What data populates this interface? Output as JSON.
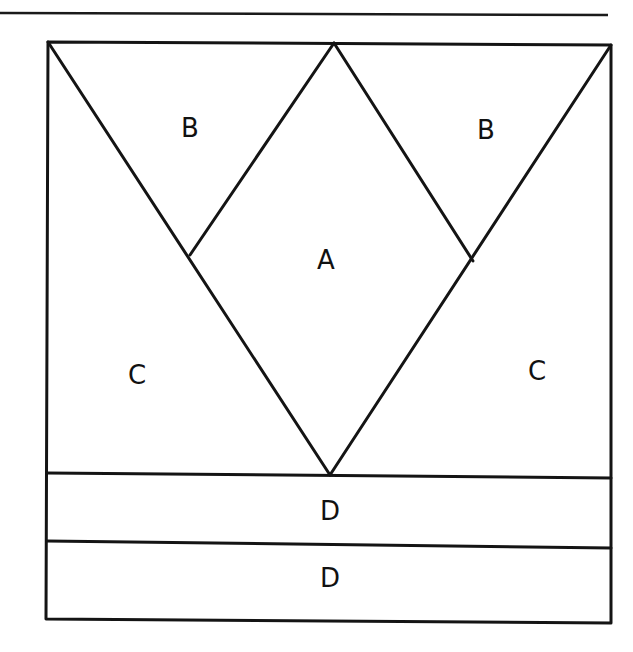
{
  "diagram": {
    "type": "quilt-block-pattern",
    "pieces": [
      {
        "id": "A",
        "label": "A",
        "shape": "diamond",
        "x": 326,
        "y": 260
      },
      {
        "id": "B1",
        "label": "B",
        "shape": "triangle",
        "x": 190,
        "y": 128
      },
      {
        "id": "B2",
        "label": "B",
        "shape": "triangle",
        "x": 486,
        "y": 130
      },
      {
        "id": "C1",
        "label": "C",
        "shape": "triangle",
        "x": 137,
        "y": 375
      },
      {
        "id": "C2",
        "label": "C",
        "shape": "triangle",
        "x": 537,
        "y": 371
      },
      {
        "id": "D1",
        "label": "D",
        "shape": "strip",
        "x": 330,
        "y": 511
      },
      {
        "id": "D2",
        "label": "D",
        "shape": "strip",
        "x": 330,
        "y": 578
      }
    ],
    "colors": {
      "line": "#141414",
      "background": "#ffffff"
    }
  }
}
